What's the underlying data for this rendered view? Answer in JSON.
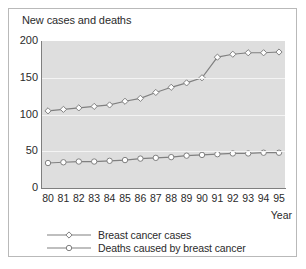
{
  "chart_data": {
    "type": "line",
    "title": "New cases and deaths",
    "xlabel": "Year",
    "ylabel": "",
    "ylim": [
      0,
      200
    ],
    "yticks": [
      0,
      50,
      100,
      150,
      200
    ],
    "grid": true,
    "legend_position": "bottom",
    "x": [
      "80",
      "81",
      "82",
      "83",
      "84",
      "85",
      "86",
      "87",
      "88",
      "89",
      "90",
      "91",
      "92",
      "93",
      "94",
      "95"
    ],
    "categories": [
      "80",
      "81",
      "82",
      "83",
      "84",
      "85",
      "86",
      "87",
      "88",
      "89",
      "90",
      "91",
      "92",
      "93",
      "94",
      "95"
    ],
    "series": [
      {
        "name": "Breast cancer cases",
        "marker": "diamond",
        "values": [
          105,
          107,
          109,
          111,
          113,
          118,
          122,
          130,
          137,
          143,
          150,
          178,
          182,
          184,
          184,
          185
        ]
      },
      {
        "name": "Deaths caused by breast cancer",
        "marker": "circle",
        "values": [
          34,
          35,
          36,
          36,
          37,
          38,
          40,
          41,
          42,
          44,
          45,
          46,
          47,
          47,
          48,
          48
        ]
      }
    ],
    "colors": {
      "line": "#808080",
      "marker_fill": "#ffffff",
      "plot_background": "#dedede",
      "gridline": "#f4f4f4",
      "axis": "#7f7f7f",
      "text": "#2b2b2b",
      "frame": "#b9b9b9"
    }
  }
}
